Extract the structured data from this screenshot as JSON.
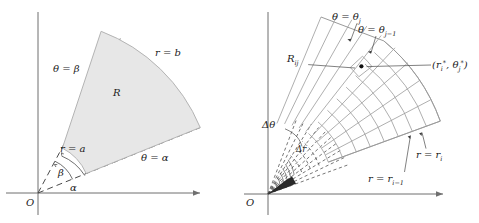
{
  "figure": {
    "panels": [
      {
        "id": "left",
        "name": "polar-region-diagram",
        "origin_label": "O",
        "region_label": "R",
        "labels": {
          "theta_beta": "θ = β",
          "theta_alpha": "θ = α",
          "r_a": "r = a",
          "r_b": "r = b",
          "alpha": "α",
          "beta": "β"
        },
        "geometry": {
          "origin": [
            38,
            193
          ],
          "alpha_deg": 22,
          "beta_deg": 62,
          "inner_radius_a": 52,
          "outer_radius_b": 175,
          "x_axis_end": [
            205,
            193
          ],
          "y_axis_top": [
            38,
            12
          ]
        }
      },
      {
        "id": "right",
        "name": "polar-subdivision-diagram",
        "origin_label": "O",
        "labels": {
          "theta_j": "θ = θ",
          "theta_j_sub": "j",
          "theta_jm1": "θ = θ",
          "theta_jm1_sub": "j−1",
          "R_ij": "R",
          "R_ij_sub": "ij",
          "sample_point_open": "(",
          "sample_point_r": "r",
          "sample_point_r_sub": "i",
          "sample_point_star1": "*",
          "sample_point_comma": ", ",
          "sample_point_theta": "θ",
          "sample_point_theta_sub": "j",
          "sample_point_star2": "*",
          "sample_point_close": ")",
          "delta_theta": "Δθ",
          "delta_r": "Δr",
          "r_i": "r = r",
          "r_i_sub": "i",
          "r_im1": "r = r",
          "r_im1_sub": "i−1"
        },
        "geometry": {
          "origin": [
            28,
            194
          ],
          "alpha_deg": 20,
          "beta_deg": 70,
          "radial_divisions": 9,
          "angular_divisions": 9,
          "inner_radius": 28,
          "outer_radius": 192,
          "x_axis_end": [
            208,
            194
          ],
          "y_axis_top": [
            28,
            12
          ]
        }
      }
    ]
  }
}
